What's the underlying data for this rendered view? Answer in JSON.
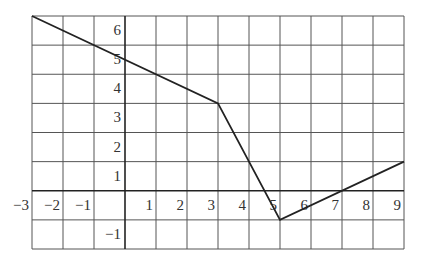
{
  "chart_data": {
    "type": "line",
    "title": "",
    "xlabel": "",
    "ylabel": "",
    "xlim": [
      -3,
      9
    ],
    "ylim": [
      -2,
      6
    ],
    "grid": true,
    "x_ticks": [
      -3,
      -2,
      -1,
      1,
      2,
      3,
      4,
      5,
      6,
      7,
      8,
      9
    ],
    "y_ticks": [
      6,
      5,
      4,
      3,
      2,
      1,
      -1
    ],
    "x_tick_labels": [
      "−3",
      "−2",
      "−1",
      "1",
      "2",
      "3",
      "4",
      "5",
      "6",
      "7",
      "8",
      "9"
    ],
    "y_tick_labels": [
      "6",
      "5",
      "4",
      "3",
      "2",
      "1",
      "−1"
    ],
    "series": [
      {
        "name": "piecewise linear function",
        "points": [
          [
            -3,
            6
          ],
          [
            3,
            3
          ],
          [
            5,
            -1
          ],
          [
            9,
            1
          ]
        ]
      }
    ],
    "legend": "none"
  }
}
